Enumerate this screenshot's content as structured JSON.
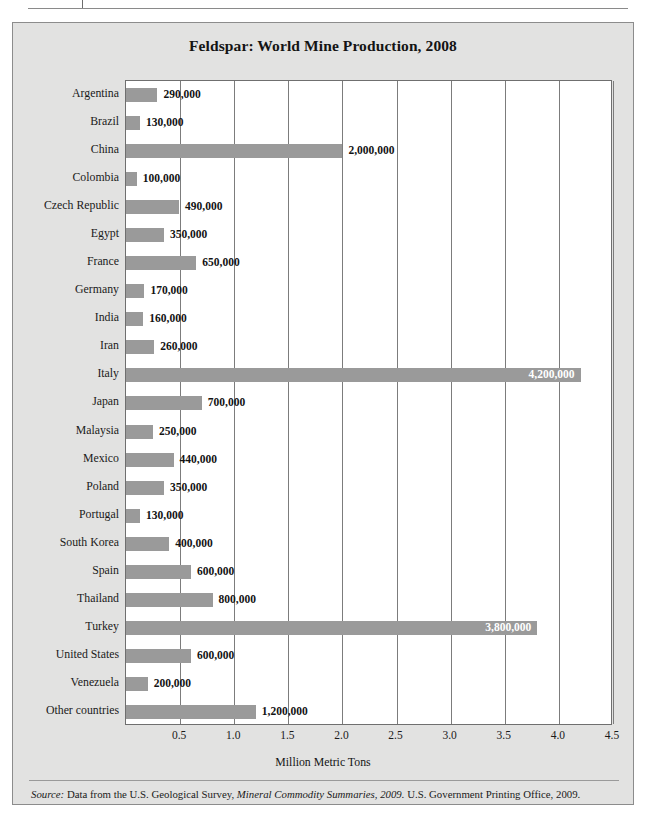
{
  "figure": {
    "title": "Feldspar: World Mine Production, 2008",
    "source_prefix": "Source:",
    "source_part1": " Data from the U.S. Geological Survey, ",
    "source_italic": "Mineral Commodity Summaries, 2009.",
    "source_part2": " U.S. Government Printing Office, 2009."
  },
  "colors": {
    "bar": "#9a9a9a",
    "plot_background": "#ffffff",
    "figure_background": "#e2e2e1",
    "frame": "#6f6f6f",
    "text": "#131313",
    "inside_label": "#ffffff"
  },
  "chart_data": {
    "type": "bar",
    "orientation": "horizontal",
    "title": "Feldspar: World Mine Production, 2008",
    "xlabel": "Million Metric Tons",
    "ylabel": "",
    "xlim": [
      0,
      4.5
    ],
    "xticks": [
      "0.5",
      "1.0",
      "1.5",
      "2.0",
      "2.5",
      "3.0",
      "3.5",
      "4.0",
      "4.5"
    ],
    "xtick_values": [
      0.5,
      1.0,
      1.5,
      2.0,
      2.5,
      3.0,
      3.5,
      4.0,
      4.5
    ],
    "grid": true,
    "legend": null,
    "units": "metric tons",
    "categories": [
      "Argentina",
      "Brazil",
      "China",
      "Colombia",
      "Czech Republic",
      "Egypt",
      "France",
      "Germany",
      "India",
      "Iran",
      "Italy",
      "Japan",
      "Malaysia",
      "Mexico",
      "Poland",
      "Portugal",
      "South Korea",
      "Spain",
      "Thailand",
      "Turkey",
      "United States",
      "Venezuela",
      "Other countries"
    ],
    "values": [
      290000,
      130000,
      2000000,
      100000,
      490000,
      350000,
      650000,
      170000,
      160000,
      260000,
      4200000,
      700000,
      250000,
      440000,
      350000,
      130000,
      400000,
      600000,
      800000,
      3800000,
      600000,
      200000,
      1200000
    ],
    "value_labels": [
      "290,000",
      "130,000",
      "2,000,000",
      "100,000",
      "490,000",
      "350,000",
      "650,000",
      "170,000",
      "160,000",
      "260,000",
      "4,200,000",
      "700,000",
      "250,000",
      "440,000",
      "350,000",
      "130,000",
      "400,000",
      "600,000",
      "800,000",
      "3,800,000",
      "600,000",
      "200,000",
      "1,200,000"
    ],
    "label_placement": [
      "outside",
      "outside",
      "outside",
      "outside",
      "outside",
      "outside",
      "outside",
      "outside",
      "outside",
      "outside",
      "inside",
      "outside",
      "outside",
      "outside",
      "outside",
      "outside",
      "outside",
      "outside",
      "outside",
      "inside",
      "outside",
      "outside",
      "outside"
    ]
  }
}
